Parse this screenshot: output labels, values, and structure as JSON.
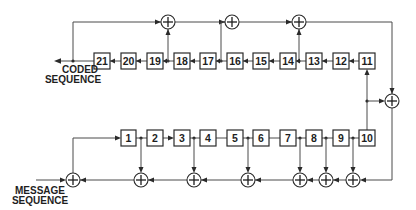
{
  "diagram": {
    "type": "convolutional-encoder-shift-register",
    "labels": {
      "output_line1": "CODED",
      "output_line2": "SEQUENCE",
      "input_line1": "MESSAGE",
      "input_line2": "SEQUENCE"
    },
    "top_register": [
      "21",
      "20",
      "19",
      "18",
      "17",
      "16",
      "15",
      "14",
      "13",
      "12",
      "11"
    ],
    "bottom_register": [
      "1",
      "2",
      "3",
      "4",
      "5",
      "6",
      "7",
      "8",
      "9",
      "10"
    ],
    "top_xor_count": 3,
    "bottom_xor_count": 7,
    "right_xor_count": 1,
    "colors": {
      "line": "#4a4a4a",
      "box_stroke": "#2a2a2a",
      "text": "#1e1e1e",
      "background": "#ffffff"
    }
  }
}
